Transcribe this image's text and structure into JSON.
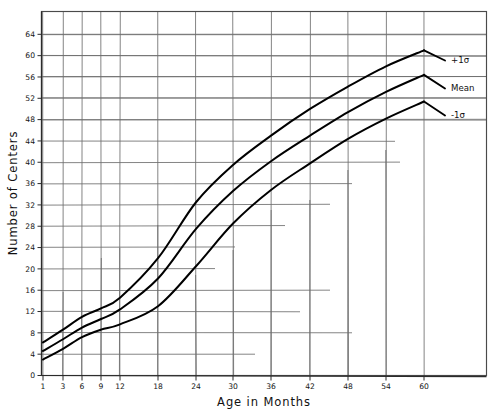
{
  "chart_data": {
    "type": "line",
    "title": "",
    "xlabel": "Age in Months",
    "ylabel": "Number of Centers",
    "xlim": [
      1,
      60
    ],
    "ylim": [
      0,
      68
    ],
    "grid": true,
    "legend_position": "right-inline",
    "x_ticks": [
      1,
      3,
      6,
      9,
      12,
      18,
      24,
      30,
      36,
      42,
      48,
      54,
      60
    ],
    "x_tick_labels": [
      "1",
      "3",
      "6",
      "9",
      "12",
      "18",
      "24",
      "30",
      "36",
      "42",
      "48",
      "54",
      "60"
    ],
    "y_ticks": [
      0,
      4,
      8,
      12,
      16,
      20,
      24,
      28,
      32,
      36,
      40,
      44,
      48,
      52,
      56,
      60,
      64
    ],
    "y_tick_labels": [
      "0",
      "4",
      "8",
      "12",
      "16",
      "20",
      "24",
      "28",
      "32",
      "36",
      "40",
      "44",
      "48",
      "52",
      "56",
      "60",
      "64"
    ],
    "x": [
      1,
      3,
      6,
      9,
      12,
      18,
      24,
      30,
      36,
      42,
      48,
      54,
      60
    ],
    "series": [
      {
        "name": "+1σ",
        "label": "+1σ",
        "color": "#000000",
        "values": [
          6.2,
          8.6,
          11.0,
          12.6,
          14.6,
          22.0,
          32.5,
          39.5,
          45.0,
          50.0,
          54.2,
          58.0,
          61.0
        ]
      },
      {
        "name": "Mean",
        "label": "Mean",
        "color": "#000000",
        "values": [
          4.6,
          6.8,
          9.0,
          10.6,
          12.4,
          18.2,
          27.5,
          34.6,
          40.2,
          45.0,
          49.4,
          53.2,
          56.4
        ]
      },
      {
        "name": "-1σ",
        "label": "-1σ",
        "color": "#000000",
        "values": [
          3.0,
          5.0,
          7.2,
          8.6,
          9.6,
          13.0,
          20.5,
          28.5,
          34.8,
          39.8,
          44.4,
          48.2,
          51.4
        ]
      }
    ]
  },
  "axes": {
    "x_title": "Age in Months",
    "y_title": "Number of Centers"
  }
}
